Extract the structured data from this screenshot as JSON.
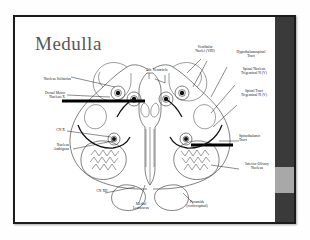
{
  "slide": {
    "title": "Medulla",
    "background_color": "#ffffff",
    "border_color": "#1b1b1b"
  },
  "rail": {
    "color": "#3a3a3a",
    "thumb_color": "#a8a8a8"
  },
  "diagram": {
    "name": "medulla-cross-section",
    "center_label": "4th Ventricle",
    "labels_left": [
      {
        "id": "nucleus-solitarius",
        "text": "Nucleus Solitarius"
      },
      {
        "id": "dorsal-motor-nucleus-x",
        "text": "Dorsal Motor\nNucleus X"
      },
      {
        "id": "cn-x",
        "text": "CN X"
      },
      {
        "id": "nucleus-ambiguus",
        "text": "Nucleus\nAmbiguus"
      }
    ],
    "labels_right": [
      {
        "id": "vestibular-nuclei",
        "text": "Vestibular\nNuclei (VIII)"
      },
      {
        "id": "hypothalamospinal-tract",
        "text": "Hypothalamospinal\nTract"
      },
      {
        "id": "spinal-nucleus-trigeminal",
        "text": "Spinal Nucleus\nTrigeminal N (V)"
      },
      {
        "id": "spinal-tract-trigeminal",
        "text": "Spinal Tract\nTrigeminal N (V)"
      },
      {
        "id": "spinothalamic-tract",
        "text": "Spinothalamic\nTract"
      },
      {
        "id": "inferior-olivary-nucleus",
        "text": "Inferior Olivary\nNucleus"
      }
    ],
    "labels_bottom": [
      {
        "id": "cn-xii",
        "text": "CN XII"
      },
      {
        "id": "medial-lemniscus",
        "text": "Medial\nLemniscus"
      },
      {
        "id": "pyramids",
        "text": "Pyramids\n(corticospinal)"
      }
    ]
  }
}
